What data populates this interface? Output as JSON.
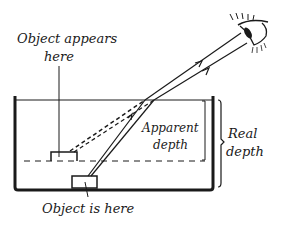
{
  "diagram": {
    "type": "refraction-apparent-depth",
    "labels": {
      "object_appears_line1": "Object appears",
      "object_appears_line2": "here",
      "object_is_here": "Object is here",
      "apparent_line1": "Apparent",
      "apparent_line2": "depth",
      "real_line1": "Real",
      "real_line2": "depth"
    },
    "colors": {
      "ink": "#1a1a1a",
      "background": "#ffffff"
    }
  }
}
